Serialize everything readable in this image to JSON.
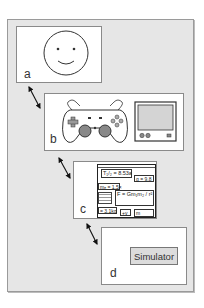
{
  "panels": {
    "a": {
      "label": "a",
      "content": "smiley-face"
    },
    "b": {
      "label": "b",
      "content": [
        "gamepad",
        "monitor"
      ]
    },
    "c": {
      "label": "c",
      "content": "formula-collage",
      "formulas": [
        "T₁/₂ = 8.53a",
        "g = 9.8",
        "mₑ = 1.5×",
        "F = Gm₁m₂ / r²",
        "= 3.1kg",
        "+v",
        "m"
      ]
    },
    "d": {
      "label": "d",
      "button": "Simulator"
    }
  },
  "colors": {
    "background": "#e6e6e6",
    "panel": "#ffffff",
    "stroke": "#333333"
  }
}
